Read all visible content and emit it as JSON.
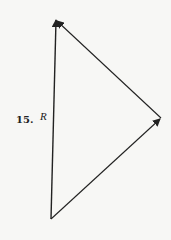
{
  "problem": {
    "number": "15.",
    "resultant_label": "R"
  },
  "diagram": {
    "type": "vector-triangle",
    "vertices": {
      "bottom": [
        51,
        219
      ],
      "right": [
        161,
        118
      ],
      "top": [
        56,
        20
      ]
    },
    "vectors": [
      {
        "name": "vector-a",
        "from": "bottom",
        "to": "right"
      },
      {
        "name": "vector-b",
        "from": "right",
        "to": "top"
      },
      {
        "name": "resultant-r",
        "from": "bottom",
        "to": "top",
        "label": "R"
      }
    ],
    "stroke_color": "#222222",
    "background": "#f7f7f5"
  }
}
